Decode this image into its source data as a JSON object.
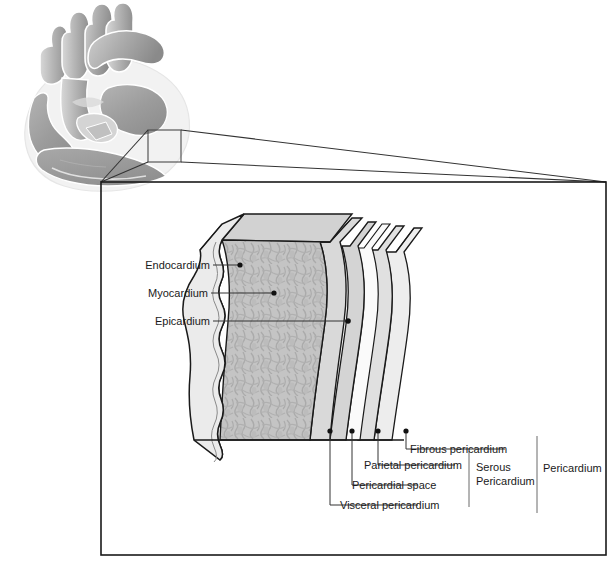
{
  "figure": {
    "type": "anatomical-diagram"
  },
  "overview": {
    "name": "heart-overview-illustration",
    "description": "Sagittal cut-away view of the heart with great vessels",
    "callout_box_label": ""
  },
  "panel": {
    "name": "magnified-cross-section-panel"
  },
  "wall_labels": [
    {
      "id": "endocardium",
      "text": "Endocardium"
    },
    {
      "id": "myocardium",
      "text": "Myocardium"
    },
    {
      "id": "epicardium",
      "text": "Epicardium"
    }
  ],
  "pericardium_labels": [
    {
      "id": "fibrous-pericardium",
      "text": "Fibrous pericardium"
    },
    {
      "id": "parietal-pericardium",
      "text": "Parietal pericardium"
    },
    {
      "id": "pericardial-space",
      "text": "Pericardial space"
    },
    {
      "id": "visceral-pericardium",
      "text": "Visceral pericardium"
    }
  ],
  "brackets": [
    {
      "id": "serous-pericardium",
      "line1": "Serous",
      "line2": "Pericardium"
    },
    {
      "id": "pericardium",
      "line1": "Pericardium",
      "line2": ""
    }
  ],
  "colors": {
    "outline": "#1a1a1a",
    "leader": "#333333",
    "endocardium_fill": "#e9e9e9",
    "myocardium_fill": "#c2c2c2",
    "myocardium_texture": "#a9a9a9",
    "epicardium_fill": "#d6d6d6",
    "visceral_fill": "#cfcfcf",
    "space_fill": "#f7f7f7",
    "parietal_fill": "#e2e2e2",
    "fibrous_fill": "#ededed",
    "heart_muscle": "#9a9a9a",
    "heart_vessel": "#b4b4b4",
    "heart_outer": "#efefef",
    "text": "#1a1a1a"
  }
}
